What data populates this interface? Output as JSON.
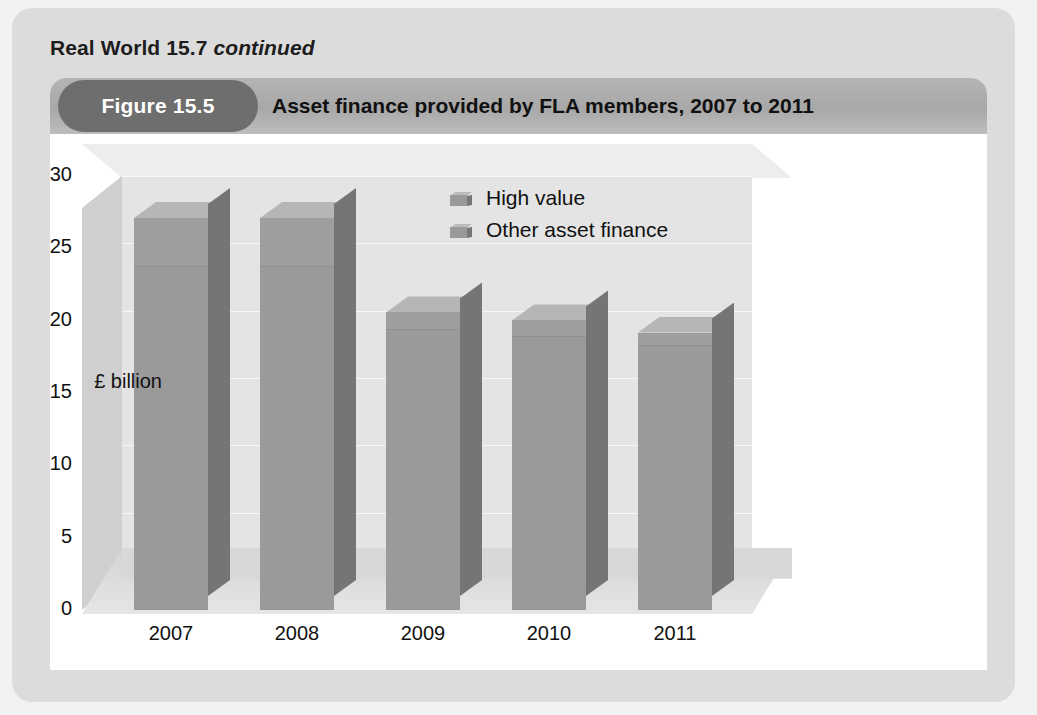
{
  "panel": {
    "heading_main": "Real World 15.7",
    "heading_continued": "continued"
  },
  "figure": {
    "pill_label": "Figure 15.5",
    "title": "Asset finance provided by FLA members, 2007 to 2011"
  },
  "chart_data": {
    "type": "bar",
    "stacked": true,
    "three_d": true,
    "title": "Asset finance provided by FLA members, 2007 to 2011",
    "xlabel": "",
    "ylabel": "£ billion",
    "categories": [
      "2007",
      "2008",
      "2009",
      "2010",
      "2011"
    ],
    "series": [
      {
        "name": "Other asset finance",
        "values": [
          25.5,
          25.5,
          20.8,
          20.3,
          19.6
        ]
      },
      {
        "name": "High value",
        "values": [
          3.6,
          3.6,
          1.3,
          1.2,
          1.0
        ]
      }
    ],
    "totals": [
      29.1,
      29.1,
      22.1,
      21.5,
      20.6
    ],
    "ylim": [
      0,
      30
    ],
    "yticks": [
      "0",
      "5",
      "10",
      "15",
      "20",
      "25",
      "30"
    ],
    "grid": true,
    "legend_position": "inside-top-right",
    "legend": [
      "High value",
      "Other asset finance"
    ],
    "colors": {
      "bar_front": "#9a9a9a",
      "bar_side": "#757575",
      "bar_top": "#b6b6b6",
      "plot_back_wall": "#e4e4e4",
      "floor": "#d8d8d8",
      "header_pill": "#6e6e6e",
      "header_bar": "#a8a8a8",
      "panel": "#dcdcdc",
      "card": "#ffffff"
    }
  }
}
